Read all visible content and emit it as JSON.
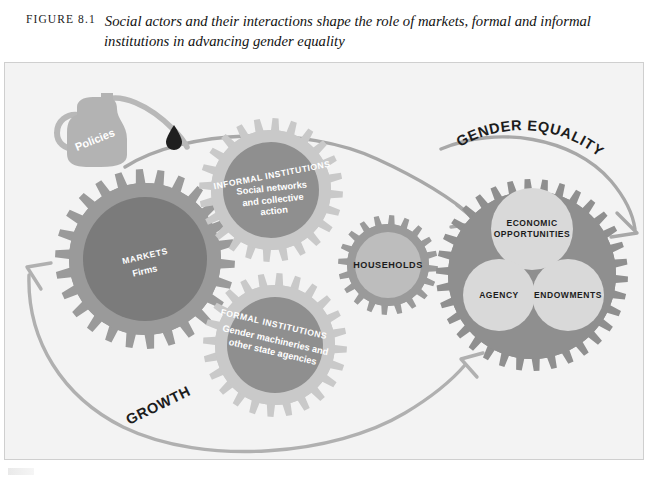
{
  "figure": {
    "number": "FIGURE 8.1",
    "title": "Social actors and their interactions shape the role of markets, formal and informal institutions in advancing gender equality"
  },
  "colors": {
    "panel_bg": "#f3f3f3",
    "panel_border": "#cfcfcf",
    "gear_tooth_dark": "#9a9a9a",
    "gear_tooth_light": "#c9c9c9",
    "gear_core_dark": "#7b7b7b",
    "gear_core_mid": "#8f8f8f",
    "gear_core_light": "#bdbdbd",
    "circle_light": "#d9d9d9",
    "arrow": "#a8a8a8",
    "oilcan": "#b5b5b5",
    "oildrop": "#1f1f1f",
    "label_light": "#ffffff",
    "label_dark": "#1c1c1c"
  },
  "oil_can": {
    "label": "Policies"
  },
  "gears": [
    {
      "id": "markets",
      "caption": "MARKETS",
      "subtitle": "Firms",
      "cx": 140,
      "cy": 196,
      "teeth": 26
    },
    {
      "id": "informal-institutions",
      "caption": "INFORMAL INSTITUTIONS",
      "subtitle": "Social networks\nand collective\naction",
      "cx": 266,
      "cy": 127,
      "teeth": 24
    },
    {
      "id": "formal-institutions",
      "caption": "FORMAL INSTITUTIONS",
      "subtitle": "Gender machineries and\nother state agencies",
      "cx": 270,
      "cy": 282,
      "teeth": 24
    },
    {
      "id": "households",
      "caption": "HOUSEHOLDS",
      "subtitle": "",
      "cx": 383,
      "cy": 202,
      "teeth": 20
    },
    {
      "id": "gender-equality",
      "caption": "",
      "subtitle": "",
      "cx": 527,
      "cy": 212,
      "teeth": 34
    }
  ],
  "equality_circles": [
    {
      "id": "economic-opportunities",
      "label": "ECONOMIC\nOPPORTUNITIES",
      "line1": "ECONOMIC",
      "line2": "OPPORTUNITIES"
    },
    {
      "id": "agency",
      "label": "AGENCY",
      "line1": "AGENCY",
      "line2": ""
    },
    {
      "id": "endowments",
      "label": "ENDOWMENTS",
      "line1": "ENDOWMENTS",
      "line2": ""
    }
  ],
  "flow_labels": {
    "gender_equality": "GENDER EQUALITY",
    "growth": "GROWTH"
  }
}
